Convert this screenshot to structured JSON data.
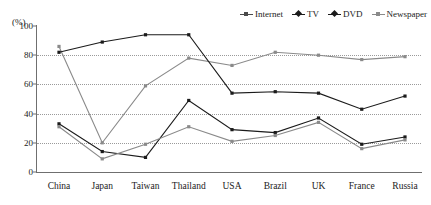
{
  "chart_data": {
    "type": "line",
    "title": "",
    "subtitle": "",
    "xlabel": "",
    "ylabel": "(%)",
    "ylim": [
      0,
      100
    ],
    "yticks": [
      0,
      20,
      40,
      60,
      80,
      100
    ],
    "grid": "horizontal-dotted at 20,40,60,80",
    "legend_position": "top-right",
    "categories": [
      "China",
      "Japan",
      "Taiwan",
      "Thailand",
      "USA",
      "Brazil",
      "UK",
      "France",
      "Russia"
    ],
    "series": [
      {
        "name": "Internet",
        "color": "#8a8a8a",
        "marker": "square",
        "values": [
          86,
          20,
          59,
          78,
          73,
          82,
          80,
          77,
          79
        ]
      },
      {
        "name": "TV",
        "color": "#1b1b1b",
        "marker": "diamond",
        "values": [
          82,
          89,
          94,
          94,
          54,
          55,
          54,
          43,
          52
        ]
      },
      {
        "name": "DVD",
        "color": "#1b1b1b",
        "marker": "diamond",
        "values": [
          33,
          14,
          10,
          49,
          29,
          27,
          37,
          19,
          24
        ]
      },
      {
        "name": "Newspaper",
        "color": "#8a8a8a",
        "marker": "square",
        "values": [
          31,
          9,
          19,
          31,
          21,
          25,
          34,
          16,
          22
        ]
      }
    ]
  },
  "legend": {
    "items": [
      {
        "label": "Internet"
      },
      {
        "label": "TV"
      },
      {
        "label": "DVD"
      },
      {
        "label": "Newspaper"
      }
    ]
  },
  "axis": {
    "unit": "(%)"
  }
}
